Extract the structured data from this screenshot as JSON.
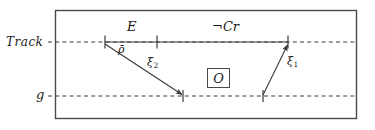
{
  "figure": {
    "width": 375,
    "height": 130,
    "background": "#ffffff",
    "stroke_color": "#4a4a4a",
    "text_color": "#1a1a1a"
  },
  "axes": [
    {
      "id": "track",
      "label": "Track",
      "label_x": 6,
      "label_y": 36,
      "line_y": 42,
      "dash_x1": 48,
      "dash_x2": 357
    },
    {
      "id": "ground",
      "label": "g",
      "label_x": 36,
      "label_y": 90,
      "line_y": 96,
      "dash_x1": 48,
      "dash_x2": 357
    }
  ],
  "frame": {
    "x": 55,
    "y": 10,
    "width": 302,
    "height": 109
  },
  "segments": [
    {
      "id": "track-solid-span",
      "x1": 105,
      "x2": 288,
      "y": 42
    }
  ],
  "ticks": [
    {
      "id": "tick-track-left",
      "x": 105,
      "y": 42
    },
    {
      "id": "tick-track-mid",
      "x": 157,
      "y": 42
    },
    {
      "id": "tick-track-right",
      "x": 288,
      "y": 42
    },
    {
      "id": "tick-ground-xi2",
      "x": 183,
      "y": 96
    },
    {
      "id": "tick-ground-xi1",
      "x": 263,
      "y": 96
    }
  ],
  "interval_labels": [
    {
      "id": "E",
      "text": "E",
      "x": 130,
      "y": 22
    },
    {
      "id": "notCr",
      "prefix": "¬",
      "text": "Cr",
      "x": 214,
      "y": 22
    }
  ],
  "arrows": [
    {
      "id": "xi2",
      "label": "ξ",
      "subscript": "2",
      "from_x": 105,
      "from_y": 44,
      "to_x": 183,
      "to_y": 95,
      "label_x": 150,
      "label_y": 62
    },
    {
      "id": "xi1",
      "label": "ξ",
      "subscript": "1",
      "from_x": 263,
      "from_y": 95,
      "to_x": 288,
      "to_y": 44,
      "label_x": 288,
      "label_y": 60
    }
  ],
  "annotations": [
    {
      "id": "rho-bar",
      "text": "ρ̄",
      "x": 120,
      "y": 44
    }
  ],
  "boxed_symbols": [
    {
      "id": "observation",
      "text": "O",
      "x": 207,
      "y": 68,
      "width": 23,
      "height": 20
    }
  ]
}
